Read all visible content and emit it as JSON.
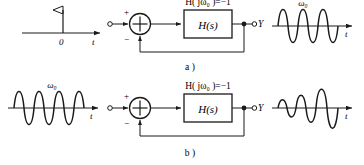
{
  "figure": {
    "background": "#ffffff",
    "ink": "#1a1a1a",
    "rows": [
      {
        "id": "row-a",
        "caption": "a )",
        "input_signal": {
          "type": "impulse",
          "axis_origin_label": "0",
          "axis_label": "t",
          "amplitude_label": ""
        },
        "summing_junction": {
          "plus_label": "+",
          "minus_label": "−",
          "symbol": "⊕"
        },
        "block": {
          "label": "H(s)"
        },
        "condition_label": "H( jω₀ )=−1",
        "output_terminal_label": "Y",
        "output_signal": {
          "type": "steady-sinusoid",
          "freq_label": "ω₀",
          "axis_label": "t"
        }
      },
      {
        "id": "row-b",
        "caption": "b )",
        "input_signal": {
          "type": "sinusoid",
          "freq_label": "ω₀",
          "axis_label": "t"
        },
        "summing_junction": {
          "plus_label": "+",
          "minus_label": "−",
          "symbol": "⊕"
        },
        "block": {
          "label": "H(s)"
        },
        "condition_label": "H( jω₀ )=−1",
        "output_terminal_label": "Y",
        "output_signal": {
          "type": "growing-sinusoid",
          "freq_label": "",
          "axis_label": "t"
        }
      }
    ]
  }
}
